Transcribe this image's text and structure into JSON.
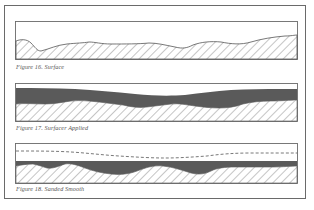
{
  "figures": [
    {
      "id": "fig16",
      "caption": "Figure 16. Surface",
      "layers": [
        "substrate-hatched"
      ]
    },
    {
      "id": "fig17",
      "caption": "Figure 17. Surfacer Applied",
      "layers": [
        "substrate-hatched",
        "surfacer"
      ]
    },
    {
      "id": "fig18",
      "caption": "Figure 18. Sanded Smooth",
      "layers": [
        "substrate-hatched",
        "surfacer",
        "original-surfacer-outline-dashed"
      ]
    }
  ],
  "colors": {
    "outline": "#6a6a6a",
    "hatch": "#6e6e6e",
    "surfacer": "#5a5a5a",
    "caption": "#555555"
  }
}
